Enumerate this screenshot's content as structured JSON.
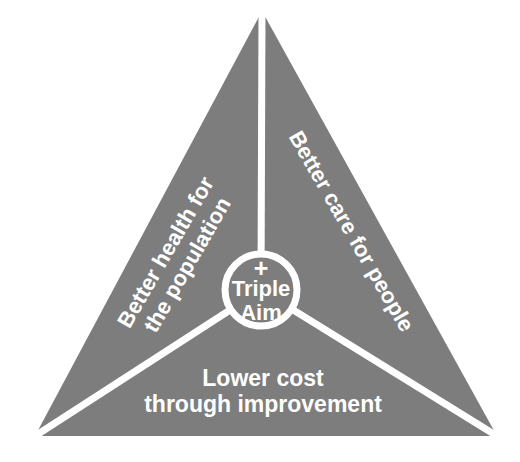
{
  "diagram": {
    "title": "Triple Aim",
    "shape": "triangle",
    "background_color": "#ffffff",
    "fill_color": "#7d7d7d",
    "line_color": "#ffffff",
    "text_color": "#ffffff",
    "center": {
      "plus_symbol": "+",
      "line1": "Triple",
      "line2": "Aim"
    },
    "segments": [
      {
        "id": "left",
        "name": "better-health-for-the-population",
        "line1": "Better health for",
        "line2": "the population",
        "rotation_deg": -60
      },
      {
        "id": "right",
        "name": "better-care-for-people",
        "line1": "Better care for people",
        "line2": "",
        "rotation_deg": 60
      },
      {
        "id": "bottom",
        "name": "lower-cost-through-improvement",
        "line1": "Lower cost",
        "line2": "through improvement",
        "rotation_deg": 0
      }
    ]
  }
}
